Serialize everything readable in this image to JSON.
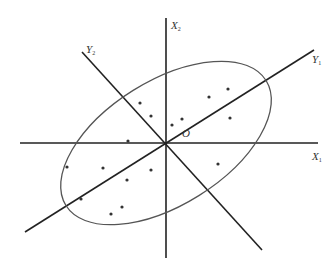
{
  "diagram": {
    "colors": {
      "axis": "#222222",
      "ellipse": "#555555",
      "point": "#333333",
      "background": "#ffffff"
    },
    "labels": {
      "x1": {
        "main": "X",
        "sub": "1"
      },
      "x2": {
        "main": "X",
        "sub": "2"
      },
      "y1": {
        "main": "Y",
        "sub": "1"
      },
      "y2": {
        "main": "Y",
        "sub": "2"
      },
      "origin": "O"
    },
    "points": [
      [
        140,
        103
      ],
      [
        151,
        116
      ],
      [
        172,
        125
      ],
      [
        182,
        119
      ],
      [
        209,
        97
      ],
      [
        228,
        89
      ],
      [
        230,
        118
      ],
      [
        218,
        164
      ],
      [
        128,
        141
      ],
      [
        67,
        167
      ],
      [
        103,
        168
      ],
      [
        151,
        170
      ],
      [
        127,
        180
      ],
      [
        81,
        199
      ],
      [
        122,
        207
      ],
      [
        111,
        214
      ]
    ]
  }
}
